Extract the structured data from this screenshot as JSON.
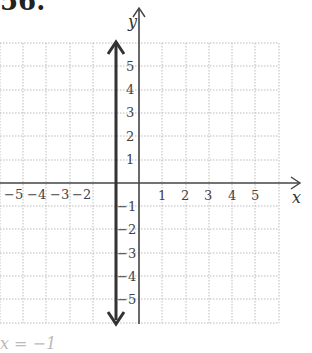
{
  "problem": {
    "number": "56."
  },
  "graph": {
    "x_axis_label": "x",
    "y_axis_label": "y",
    "x_ticks_negative": [
      "−5",
      "−4",
      "−3",
      "−2"
    ],
    "x_ticks_positive": [
      "1",
      "2",
      "3",
      "4",
      "5"
    ],
    "y_ticks_positive": [
      "5",
      "4",
      "3",
      "2",
      "1"
    ],
    "y_ticks_negative": [
      "−1",
      "−2",
      "−3",
      "−4",
      "−5"
    ],
    "grid_range": {
      "xmin": -6,
      "xmax": 6,
      "ymin": -6,
      "ymax": 6
    },
    "plotted_line": {
      "equation": "x = −1",
      "type": "vertical",
      "x": -1
    },
    "colors": {
      "grid": "#bbbbbb",
      "axis": "#444444",
      "line": "#333333"
    }
  },
  "caption": "x = −1"
}
